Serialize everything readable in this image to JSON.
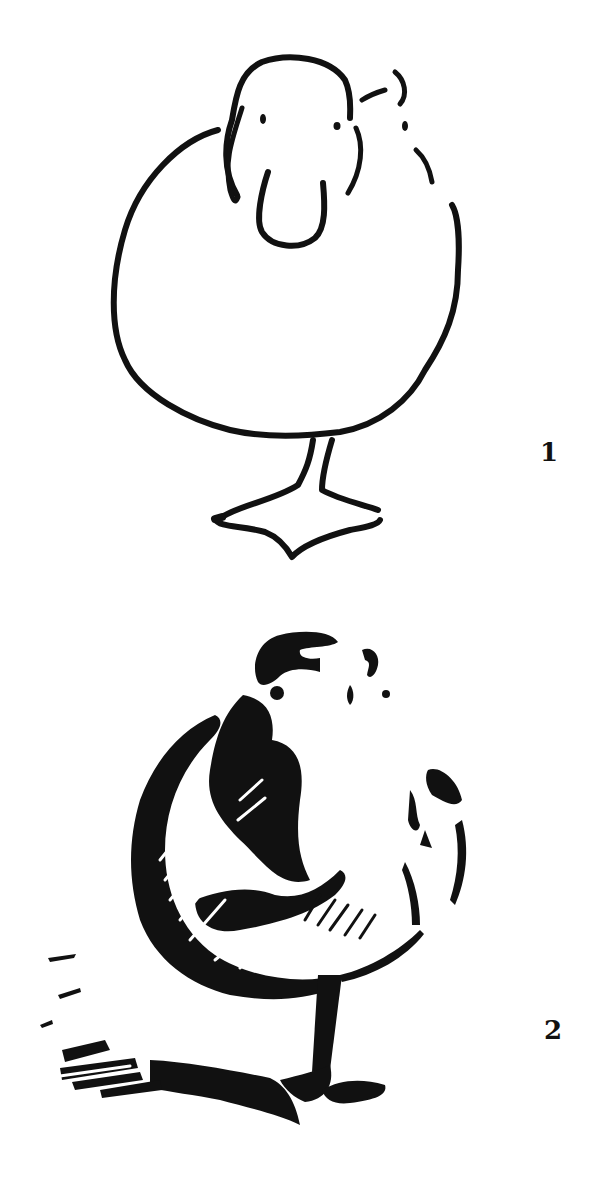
{
  "illustration": {
    "subject": "duck",
    "ink_color": "#111111",
    "background_color": "#ffffff",
    "steps": [
      {
        "number": "1",
        "description": "outline drawing of duck standing on one leg"
      },
      {
        "number": "2",
        "description": "shaded woodcut-style drawing of duck with cast shadow"
      }
    ]
  }
}
